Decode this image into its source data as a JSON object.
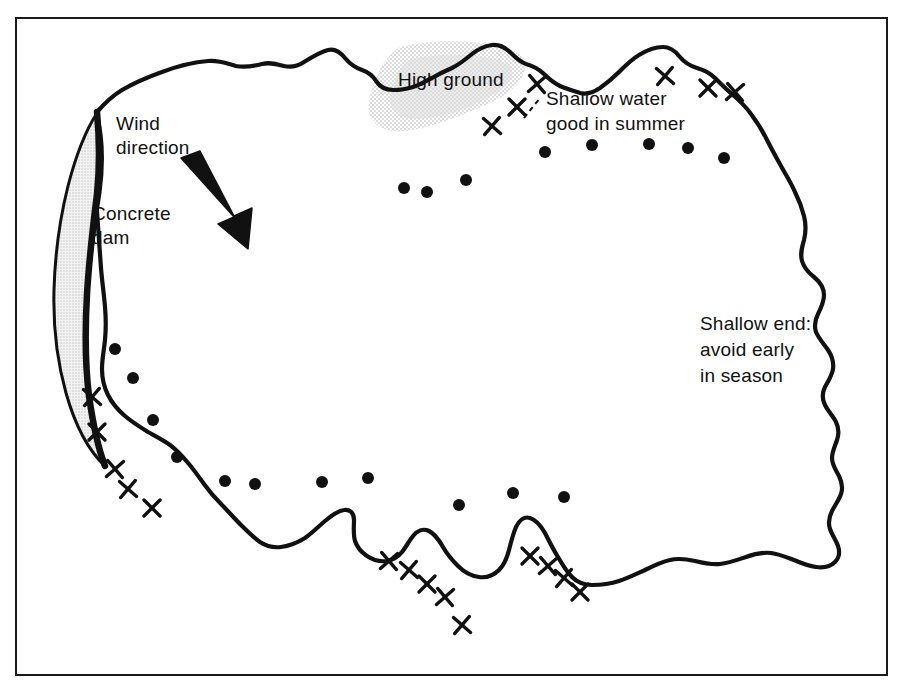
{
  "figure": {
    "type": "diagram",
    "background_color": "#ffffff",
    "ink_color": "#111111",
    "border": {
      "present": true,
      "color": "#1a1a1a",
      "thickness_px": 2,
      "x": 15,
      "y": 17,
      "width": 873,
      "height": 659
    }
  },
  "labels": {
    "wind_direction": {
      "lines": [
        "Wind",
        "direction"
      ],
      "x": 116,
      "y": 130
    },
    "concrete_dam": {
      "lines": [
        "Concrete",
        "dam"
      ],
      "x": 92,
      "y": 220
    },
    "high_ground": {
      "lines": [
        "High ground"
      ],
      "x": 398,
      "y": 86
    },
    "shallow_water": {
      "lines": [
        "Shallow water",
        "good in summer"
      ],
      "x": 546,
      "y": 105
    },
    "shallow_end": {
      "lines": [
        "Shallow end:",
        "avoid early",
        "in season"
      ],
      "x": 700,
      "y": 330
    }
  },
  "features": {
    "high_ground_shading": {
      "name": "high-ground-stipple",
      "color": "#d9d9d9",
      "opacity": 0.85
    },
    "concrete_dam": {
      "name": "concrete-dam",
      "fill_color": "#e3e3e3",
      "outline_color": "#111111",
      "shape": "crescent"
    },
    "wind_arrow": {
      "name": "wind-direction-arrow",
      "color": "#111111",
      "direction_degrees": 55,
      "from": [
        185,
        162
      ],
      "to": [
        248,
        247
      ]
    }
  },
  "markers": {
    "legend_meaning": {
      "dot": "deep water mark",
      "cross": "shallow / snag mark"
    },
    "dot_color": "#111111",
    "cross_color": "#111111",
    "dot_radius": 6,
    "dots": [
      [
        404,
        188
      ],
      [
        427,
        192
      ],
      [
        466,
        180
      ],
      [
        545,
        152
      ],
      [
        592,
        145
      ],
      [
        649,
        144
      ],
      [
        688,
        148
      ],
      [
        724,
        158
      ],
      [
        115,
        349
      ],
      [
        133,
        378
      ],
      [
        153,
        420
      ],
      [
        177,
        457
      ],
      [
        225,
        481
      ],
      [
        255,
        484
      ],
      [
        322,
        482
      ],
      [
        368,
        478
      ],
      [
        459,
        505
      ],
      [
        513,
        493
      ],
      [
        564,
        497
      ]
    ],
    "crosses": [
      [
        492,
        126
      ],
      [
        517,
        107
      ],
      [
        537,
        84
      ],
      [
        665,
        76
      ],
      [
        708,
        88
      ],
      [
        735,
        92
      ],
      [
        92,
        397
      ],
      [
        97,
        432
      ],
      [
        115,
        469
      ],
      [
        128,
        489
      ],
      [
        152,
        508
      ],
      [
        389,
        561
      ],
      [
        409,
        570
      ],
      [
        427,
        584
      ],
      [
        445,
        597
      ],
      [
        462,
        625
      ],
      [
        530,
        556
      ],
      [
        548,
        566
      ],
      [
        564,
        578
      ],
      [
        580,
        592
      ]
    ]
  },
  "chart_data": {
    "type": "diagram",
    "annotations": [
      "Wind direction",
      "Concrete dam",
      "High ground",
      "Shallow water good in summer",
      "Shallow end: avoid early in season"
    ],
    "marker_counts": {
      "dots": 19,
      "crosses": 20
    }
  }
}
